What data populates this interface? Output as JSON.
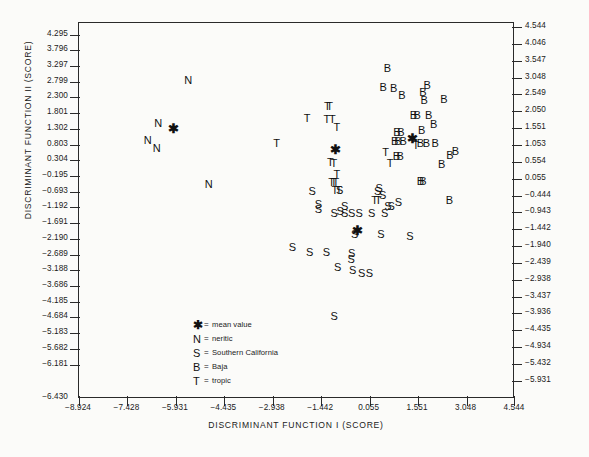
{
  "chart_data": {
    "type": "scatter",
    "title": "",
    "xlabel": "DISCRIMINANT FUNCTION I (SCORE)",
    "ylabel": "DISCRIMINANT FUNCTION II (SCORE)",
    "grid": false,
    "legend_position": "inside-lower-left",
    "xlim": [
      -8.924,
      4.544
    ],
    "ylim": [
      -6.43,
      4.295
    ],
    "y2lim": [
      -6.181,
      4.544
    ],
    "xticks": [
      "-8.924",
      "-7.428",
      "-5.931",
      "-4.435",
      "-2.938",
      "-1.442",
      "0.055",
      "1.551",
      "3.048",
      "4.544"
    ],
    "yticks_left": [
      "4.295",
      "3.796",
      "3.297",
      "2.799",
      "2.300",
      "1.801",
      "1.302",
      "0.803",
      "0.304",
      "-0.195",
      "-0.693",
      "-1.192",
      "-1.691",
      "-2.190",
      "-2.689",
      "-3.188",
      "-3.686",
      "-4.185",
      "-4.684",
      "-5.183",
      "-5.682",
      "-6.181",
      "-6.430"
    ],
    "yticks_right": [
      "4.544",
      "4.046",
      "3.547",
      "3.048",
      "2.549",
      "2.050",
      "1.551",
      "1.053",
      "0.554",
      "0.055",
      "-0.444",
      "-0.943",
      "-1.442",
      "-1.940",
      "-2.439",
      "-2.938",
      "-3.437",
      "-3.936",
      "-4.435",
      "-4.934",
      "-5.432",
      "-5.931"
    ],
    "legend": [
      {
        "symbol": "✱",
        "label": "mean value",
        "key": "mean"
      },
      {
        "symbol": "N",
        "label": "neritic",
        "key": "N"
      },
      {
        "symbol": "S",
        "label": "Southern California",
        "key": "S"
      },
      {
        "symbol": "B",
        "label": "Baja",
        "key": "B"
      },
      {
        "symbol": "T",
        "label": "tropic",
        "key": "T"
      }
    ],
    "series": [
      {
        "name": "neritic",
        "symbol": "N",
        "points": [
          {
            "x": -5.55,
            "y": 2.67
          },
          {
            "x": -6.48,
            "y": 1.44
          },
          {
            "x": -6.8,
            "y": 0.95
          },
          {
            "x": -6.52,
            "y": 0.74
          },
          {
            "x": -4.92,
            "y": -0.3
          }
        ]
      },
      {
        "name": "tropic",
        "symbol": "T",
        "points": [
          {
            "x": -1.88,
            "y": 1.58
          },
          {
            "x": -1.27,
            "y": 1.55
          },
          {
            "x": -1.1,
            "y": 1.55
          },
          {
            "x": -0.96,
            "y": 1.33
          },
          {
            "x": -1.25,
            "y": 1.94
          },
          {
            "x": -1.18,
            "y": 1.94
          },
          {
            "x": -2.82,
            "y": 0.86
          },
          {
            "x": -1.16,
            "y": 0.34
          },
          {
            "x": -1.05,
            "y": 0.3
          },
          {
            "x": -0.96,
            "y": 0.0
          },
          {
            "x": -1.12,
            "y": -0.23
          },
          {
            "x": -1.05,
            "y": -0.23
          },
          {
            "x": -0.99,
            "y": -0.23
          },
          {
            "x": -1.02,
            "y": -0.46
          },
          {
            "x": -0.9,
            "y": -0.46
          },
          {
            "x": 0.69,
            "y": 0.3
          },
          {
            "x": 0.55,
            "y": 0.62
          },
          {
            "x": 1.48,
            "y": 0.81
          },
          {
            "x": 0.21,
            "y": -0.74
          },
          {
            "x": 0.32,
            "y": -0.74
          }
        ]
      },
      {
        "name": "Baja",
        "symbol": "B",
        "points": [
          {
            "x": 0.6,
            "y": 3.02
          },
          {
            "x": 0.47,
            "y": 2.46
          },
          {
            "x": 0.8,
            "y": 2.44
          },
          {
            "x": 1.05,
            "y": 2.23
          },
          {
            "x": 1.83,
            "y": 2.53
          },
          {
            "x": 1.7,
            "y": 2.32
          },
          {
            "x": 1.74,
            "y": 2.1
          },
          {
            "x": 2.35,
            "y": 2.12
          },
          {
            "x": 1.41,
            "y": 1.66
          },
          {
            "x": 1.52,
            "y": 1.66
          },
          {
            "x": 1.88,
            "y": 1.66
          },
          {
            "x": 2.03,
            "y": 1.42
          },
          {
            "x": 0.9,
            "y": 1.19
          },
          {
            "x": 1.02,
            "y": 1.19
          },
          {
            "x": 0.83,
            "y": 0.92
          },
          {
            "x": 0.93,
            "y": 0.92
          },
          {
            "x": 1.09,
            "y": 0.92
          },
          {
            "x": 1.66,
            "y": 1.23
          },
          {
            "x": 1.62,
            "y": 0.88
          },
          {
            "x": 1.81,
            "y": 0.88
          },
          {
            "x": 2.08,
            "y": 0.88
          },
          {
            "x": 0.88,
            "y": 0.5
          },
          {
            "x": 1.0,
            "y": 0.5
          },
          {
            "x": 2.53,
            "y": 0.54
          },
          {
            "x": 2.7,
            "y": 0.63
          },
          {
            "x": 2.28,
            "y": 0.26
          },
          {
            "x": 2.52,
            "y": -0.75
          },
          {
            "x": 1.62,
            "y": -0.2
          },
          {
            "x": 1.7,
            "y": -0.2
          }
        ]
      },
      {
        "name": "Southern California",
        "symbol": "S",
        "points": [
          {
            "x": -1.72,
            "y": -0.5
          },
          {
            "x": -0.87,
            "y": -0.48
          },
          {
            "x": -1.53,
            "y": -0.88
          },
          {
            "x": -1.53,
            "y": -1.0
          },
          {
            "x": -0.72,
            "y": -0.93
          },
          {
            "x": -0.86,
            "y": -1.08
          },
          {
            "x": -1.04,
            "y": -1.13
          },
          {
            "x": -0.72,
            "y": -1.13
          },
          {
            "x": -0.5,
            "y": -1.13
          },
          {
            "x": -0.27,
            "y": -1.13
          },
          {
            "x": 0.12,
            "y": -1.13
          },
          {
            "x": 0.52,
            "y": -1.13
          },
          {
            "x": 0.35,
            "y": -0.42
          },
          {
            "x": 0.46,
            "y": -0.6
          },
          {
            "x": 0.3,
            "y": -0.5
          },
          {
            "x": 0.94,
            "y": -0.8
          },
          {
            "x": 0.62,
            "y": -0.92
          },
          {
            "x": 0.72,
            "y": -0.92
          },
          {
            "x": -0.41,
            "y": -1.72
          },
          {
            "x": 0.4,
            "y": -1.71
          },
          {
            "x": 1.3,
            "y": -1.78
          },
          {
            "x": -2.33,
            "y": -2.1
          },
          {
            "x": -1.8,
            "y": -2.24
          },
          {
            "x": -1.28,
            "y": -2.24
          },
          {
            "x": -0.5,
            "y": -2.27
          },
          {
            "x": -0.52,
            "y": -2.43
          },
          {
            "x": -0.93,
            "y": -2.67
          },
          {
            "x": -0.47,
            "y": -2.76
          },
          {
            "x": -0.19,
            "y": -2.84
          },
          {
            "x": 0.05,
            "y": -2.84
          },
          {
            "x": -1.04,
            "y": -4.05
          }
        ]
      },
      {
        "name": "mean value",
        "symbol": "✱",
        "points": [
          {
            "x": -6.0,
            "y": 1.31
          },
          {
            "x": -1.0,
            "y": 0.7
          },
          {
            "x": 1.38,
            "y": 1.02
          },
          {
            "x": -0.31,
            "y": -1.62
          }
        ]
      }
    ]
  }
}
